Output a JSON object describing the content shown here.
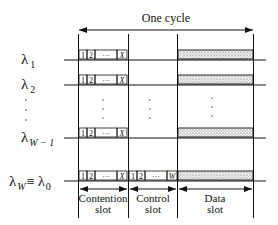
{
  "title": "One cycle",
  "wavelengths": [
    {
      "label": "λ",
      "sub": "1",
      "extra": ""
    },
    {
      "label": "λ",
      "sub": "2",
      "extra": ""
    },
    {
      "label": "λ",
      "sub": "W − 1",
      "extra": ""
    },
    {
      "label": "λ",
      "sub": "W",
      "extra": "≡ λ",
      "extra_sub": "0"
    }
  ],
  "vertical_dots": "⋮",
  "contention_slots": [
    "1",
    "2",
    "···",
    "X"
  ],
  "control_slots": [
    "1",
    "2",
    "···",
    "W"
  ],
  "slots": [
    {
      "line1": "Contention",
      "line2": "slot"
    },
    {
      "line1": "Control",
      "line2": "slot"
    },
    {
      "line1": "Data",
      "line2": "slot"
    }
  ],
  "colors": {
    "line": "#111111",
    "stipple": "#d8d8d8"
  }
}
